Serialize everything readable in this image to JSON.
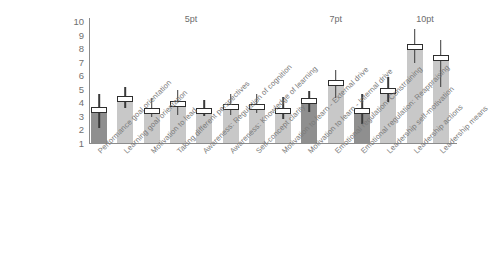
{
  "chart_data": {
    "type": "bar",
    "title": "",
    "xlabel": "",
    "ylabel": "",
    "ylim": [
      1,
      10
    ],
    "grid": false,
    "legend": "none",
    "y_ticks": [
      "10",
      "9",
      "8",
      "7",
      "6",
      "5",
      "4",
      "3",
      "2",
      "1"
    ],
    "group_annotations": [
      {
        "label": "5pt",
        "x_center_index": 3.5
      },
      {
        "label": "7pt",
        "x_center_index": 9.0
      },
      {
        "label": "10pt",
        "x_center_index": 12.4
      }
    ],
    "categories": [
      "Performance goal orientation",
      "Learning goal orientation",
      "Motivation to lead",
      "Taking different perspectives",
      "Awareness: Regulation of cognition",
      "Awareness: Knowledge of learning",
      "Self-concept clarity",
      "Motivation to learn - External drive",
      "Motivation to learn - Internal drive",
      "Emotional regulation: Constraining",
      "Emotional regulation: Reappraising",
      "Leadership self-motivation",
      "Leadership actions",
      "Leadership means"
    ],
    "values": [
      3.5,
      4.2,
      3.4,
      3.9,
      3.4,
      3.7,
      3.7,
      3.4,
      4.0,
      5.4,
      3.3,
      4.8,
      8.0,
      7.2
    ],
    "medians": [
      3.5,
      4.3,
      3.4,
      3.9,
      3.4,
      3.7,
      3.7,
      3.4,
      4.1,
      5.5,
      3.4,
      4.9,
      8.1,
      7.3
    ],
    "whisker_low": [
      2.1,
      3.6,
      2.9,
      3.1,
      3.0,
      3.1,
      3.2,
      2.8,
      3.3,
      4.3,
      2.4,
      4.0,
      6.9,
      5.1
    ],
    "whisker_high": [
      4.6,
      5.1,
      4.3,
      4.9,
      4.2,
      4.6,
      4.6,
      4.4,
      4.8,
      6.4,
      4.6,
      5.9,
      9.4,
      8.6
    ],
    "bar_shades": [
      "dark",
      "light",
      "light",
      "light",
      "light",
      "light",
      "light",
      "light",
      "dark",
      "light",
      "dark",
      "light",
      "light",
      "light"
    ],
    "colors": {
      "bar_light": "#c8c8c8",
      "bar_dark": "#8f8f8f",
      "whisker": "#3a3a3a",
      "median_fill": "#ffffff",
      "axis": "#8c8c8c",
      "tick_text": "#6f6f6f",
      "category_text": "#7a7a7a",
      "group_text": "#6d6d6d",
      "background": "#ffffff"
    }
  }
}
